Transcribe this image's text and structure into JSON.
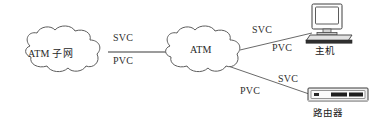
{
  "diagram": {
    "background_color": "#ffffff",
    "line_color": "#555555",
    "text_color": "#262626",
    "width": 386,
    "height": 125
  },
  "nodes": {
    "cloud_left": {
      "label": "ATM 子网",
      "type": "cloud"
    },
    "cloud_mid": {
      "label": "ATM",
      "type": "cloud"
    },
    "host": {
      "label": "主机",
      "type": "computer"
    },
    "router": {
      "label": "路由器",
      "type": "router"
    }
  },
  "links": [
    {
      "id": "link-subnet-atm",
      "from": "cloud_left",
      "to": "cloud_mid",
      "above_label": "SVC",
      "below_label": "PVC"
    },
    {
      "id": "link-atm-host",
      "from": "cloud_mid",
      "to": "host",
      "above_label": "SVC",
      "below_label": "PVC"
    },
    {
      "id": "link-atm-router",
      "from": "cloud_mid",
      "to": "router",
      "above_label": "SVC",
      "below_label": "PVC"
    }
  ],
  "icons": {
    "cloud": "cloud-icon",
    "computer": "desktop-computer-icon",
    "router": "router-device-icon"
  }
}
